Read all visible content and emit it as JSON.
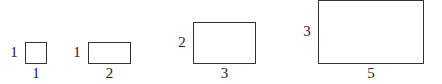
{
  "diagram": {
    "rectangles": [
      {
        "height_label": "1",
        "width_label": "1",
        "x": 25,
        "y": 42,
        "w": 22,
        "h": 22
      },
      {
        "height_label": "1",
        "width_label": "2",
        "x": 88,
        "y": 42,
        "w": 43,
        "h": 22
      },
      {
        "height_label": "2",
        "width_label": "3",
        "x": 193,
        "y": 22,
        "w": 63,
        "h": 42
      },
      {
        "height_label": "3",
        "width_label": "5",
        "x": 318,
        "y": 0,
        "w": 106,
        "h": 64
      }
    ],
    "colors": {
      "stroke": "#333333",
      "text": "#222222",
      "background": "#ffffff"
    }
  }
}
